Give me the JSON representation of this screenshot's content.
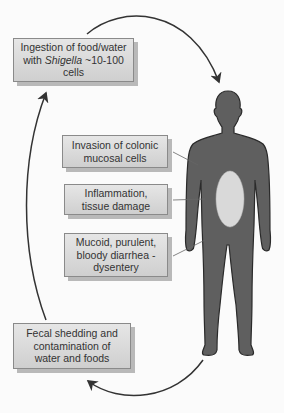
{
  "diagram": {
    "boxes": {
      "ingestion": {
        "line1": "Ingestion of food/water",
        "line2_pre": "with ",
        "line2_italic": "Shigella",
        "line2_post": " ~10-100",
        "line3": "cells"
      },
      "invasion": {
        "line1": "Invasion of colonic",
        "line2": "mucosal cells"
      },
      "inflammation": {
        "line1": "Inflammation,",
        "line2": "tissue damage"
      },
      "mucoid": {
        "line1": "Mucoid, purulent,",
        "line2": "bloody diarrhea -",
        "line3": "dysentery"
      },
      "fecal": {
        "line1": "Fecal shedding and",
        "line2": "contamination of",
        "line3": "water and foods"
      }
    },
    "colors": {
      "body": "#5f5f5f",
      "colon": "#d9d9d9",
      "box_fill": "#dadada",
      "arrow": "#333333"
    }
  }
}
